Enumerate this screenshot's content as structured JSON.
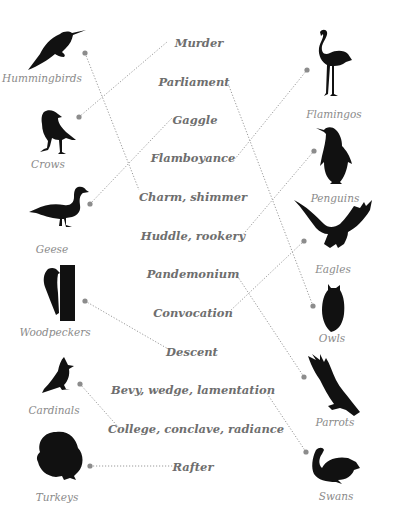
{
  "colors": {
    "silhouette": "#111111",
    "bird_label": "#8a8a8a",
    "term": "#6e6e6e",
    "connector": "#9a9a9a",
    "dot": "#8c8c8c"
  },
  "left_birds": [
    {
      "name": "Hummingbirds",
      "icon": "hummingbird-icon",
      "term": "Charm, shimmer"
    },
    {
      "name": "Crows",
      "icon": "crow-icon",
      "term": "Murder"
    },
    {
      "name": "Geese",
      "icon": "goose-icon",
      "term": "Gaggle"
    },
    {
      "name": "Woodpeckers",
      "icon": "woodpecker-icon",
      "term": "Descent"
    },
    {
      "name": "Cardinals",
      "icon": "cardinal-icon",
      "term": "College, conclave, radiance"
    },
    {
      "name": "Turkeys",
      "icon": "turkey-icon",
      "term": "Rafter"
    }
  ],
  "right_birds": [
    {
      "name": "Flamingos",
      "icon": "flamingo-icon",
      "term": "Flamboyance"
    },
    {
      "name": "Penguins",
      "icon": "penguin-icon",
      "term": "Huddle, rookery"
    },
    {
      "name": "Eagles",
      "icon": "eagle-icon",
      "term": "Convocation"
    },
    {
      "name": "Owls",
      "icon": "owl-icon",
      "term": "Parliament"
    },
    {
      "name": "Parrots",
      "icon": "parrot-icon",
      "term": "Pandemonium"
    },
    {
      "name": "Swans",
      "icon": "swan-icon",
      "term": "Bevy, wedge, lamentation"
    }
  ],
  "terms": [
    "Murder",
    "Parliament",
    "Gaggle",
    "Flamboyance",
    "Charm, shimmer",
    "Huddle, rookery",
    "Pandemonium",
    "Convocation",
    "Descent",
    "Bevy, wedge, lamentation",
    "College, conclave, radiance",
    "Rafter"
  ],
  "connections": [
    {
      "from": "Hummingbirds",
      "to": "Charm, shimmer"
    },
    {
      "from": "Crows",
      "to": "Murder"
    },
    {
      "from": "Geese",
      "to": "Gaggle"
    },
    {
      "from": "Woodpeckers",
      "to": "Descent"
    },
    {
      "from": "Cardinals",
      "to": "College, conclave, radiance"
    },
    {
      "from": "Turkeys",
      "to": "Rafter"
    },
    {
      "from": "Flamingos",
      "to": "Flamboyance"
    },
    {
      "from": "Penguins",
      "to": "Huddle, rookery"
    },
    {
      "from": "Eagles",
      "to": "Convocation"
    },
    {
      "from": "Owls",
      "to": "Parliament"
    },
    {
      "from": "Parrots",
      "to": "Pandemonium"
    },
    {
      "from": "Swans",
      "to": "Bevy, wedge, lamentation"
    }
  ]
}
